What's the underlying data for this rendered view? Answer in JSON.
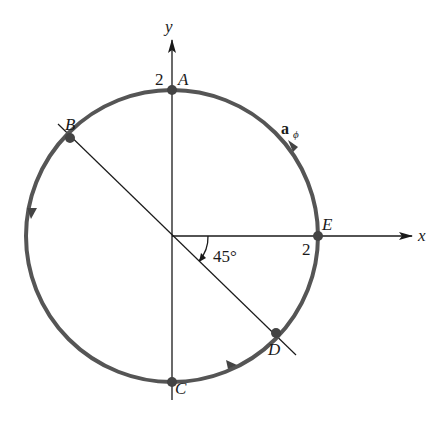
{
  "diagram": {
    "type": "circular-path-polar",
    "axes": {
      "x_label": "x",
      "y_label": "y"
    },
    "circle": {
      "radius": 2,
      "stroke_color": "#555555"
    },
    "points": [
      {
        "name": "A",
        "coords": [
          0,
          2
        ]
      },
      {
        "name": "B",
        "coords": [
          -1.414,
          1.414
        ]
      },
      {
        "name": "C",
        "coords": [
          0,
          -2
        ]
      },
      {
        "name": "D",
        "coords": [
          1.414,
          -1.414
        ]
      },
      {
        "name": "E",
        "coords": [
          2,
          0
        ]
      }
    ],
    "tick_labels": {
      "y_tick": "2",
      "x_tick": "2"
    },
    "angle_label": "45°",
    "unit_vector_label": {
      "main": "a",
      "subscript": "ϕ"
    },
    "line_color": "#1a1a1a"
  }
}
